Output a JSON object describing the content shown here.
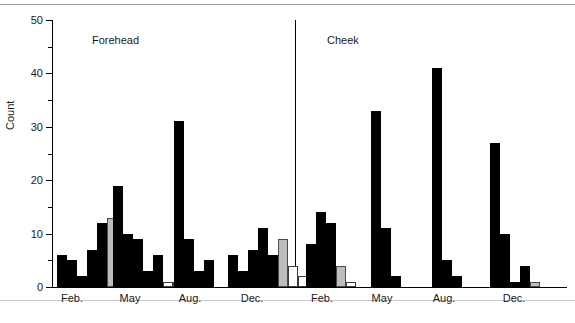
{
  "figure": {
    "ylabel": "Count",
    "panels": [
      {
        "title": "Forehead"
      },
      {
        "title": "Cheek"
      }
    ]
  },
  "chart_data": {
    "type": "bar",
    "title": "",
    "xlabel": "",
    "ylabel": "Count",
    "ylim": [
      0,
      50
    ],
    "ytick_labels": [
      "0",
      "10",
      "20",
      "30",
      "40",
      "50"
    ],
    "ytick_values": [
      0,
      10,
      20,
      30,
      40,
      50
    ],
    "yminor_values": [
      5,
      15,
      25,
      35,
      45
    ],
    "grid": false,
    "legend": "none",
    "panels": [
      {
        "name": "Forehead",
        "groups": [
          {
            "category": "Feb.",
            "bars": [
              {
                "value": 6,
                "fill": "black"
              },
              {
                "value": 5,
                "fill": "black"
              },
              {
                "value": 2,
                "fill": "black"
              },
              {
                "value": 7,
                "fill": "black"
              },
              {
                "value": 12,
                "fill": "black"
              },
              {
                "value": 13,
                "fill": "gray"
              },
              {
                "value": 10,
                "fill": "white"
              }
            ]
          },
          {
            "category": "May",
            "bars": [
              {
                "value": 19,
                "fill": "black"
              },
              {
                "value": 10,
                "fill": "black"
              },
              {
                "value": 9,
                "fill": "black"
              },
              {
                "value": 3,
                "fill": "black"
              },
              {
                "value": 6,
                "fill": "black"
              },
              {
                "value": 1,
                "fill": "white"
              },
              {
                "value": 1,
                "fill": "white"
              }
            ]
          },
          {
            "category": "Aug.",
            "bars": [
              {
                "value": 31,
                "fill": "black"
              },
              {
                "value": 9,
                "fill": "black"
              },
              {
                "value": 3,
                "fill": "black"
              },
              {
                "value": 5,
                "fill": "black"
              }
            ]
          },
          {
            "category": "Dec.",
            "bars": [
              {
                "value": 6,
                "fill": "black"
              },
              {
                "value": 3,
                "fill": "black"
              },
              {
                "value": 7,
                "fill": "black"
              },
              {
                "value": 11,
                "fill": "black"
              },
              {
                "value": 6,
                "fill": "black"
              },
              {
                "value": 9,
                "fill": "gray"
              },
              {
                "value": 4,
                "fill": "white"
              },
              {
                "value": 2,
                "fill": "white"
              }
            ]
          }
        ]
      },
      {
        "name": "Cheek",
        "groups": [
          {
            "category": "Feb.",
            "bars": [
              {
                "value": 8,
                "fill": "black"
              },
              {
                "value": 14,
                "fill": "black"
              },
              {
                "value": 12,
                "fill": "black"
              },
              {
                "value": 4,
                "fill": "gray"
              },
              {
                "value": 1,
                "fill": "white"
              }
            ]
          },
          {
            "category": "May",
            "bars": [
              {
                "value": 33,
                "fill": "black"
              },
              {
                "value": 11,
                "fill": "black"
              },
              {
                "value": 2,
                "fill": "black"
              }
            ]
          },
          {
            "category": "Aug.",
            "bars": [
              {
                "value": 41,
                "fill": "black"
              },
              {
                "value": 5,
                "fill": "black"
              },
              {
                "value": 2,
                "fill": "black"
              }
            ]
          },
          {
            "category": "Dec.",
            "bars": [
              {
                "value": 27,
                "fill": "black"
              },
              {
                "value": 10,
                "fill": "black"
              },
              {
                "value": 1,
                "fill": "black"
              },
              {
                "value": 4,
                "fill": "black"
              },
              {
                "value": 1,
                "fill": "gray"
              }
            ]
          }
        ]
      }
    ]
  },
  "layout": {
    "plot_left": 52,
    "plot_top": 20,
    "plot_width": 515,
    "plot_height": 267,
    "panel_divider_x": 243,
    "bar_width": 10,
    "group_x_centers": [
      [
        72,
        130,
        190,
        252
      ],
      [
        322,
        382,
        444,
        514
      ]
    ],
    "group_start_x": [
      [
        57,
        113,
        174,
        228
      ],
      [
        306,
        371,
        432,
        490
      ]
    ]
  }
}
